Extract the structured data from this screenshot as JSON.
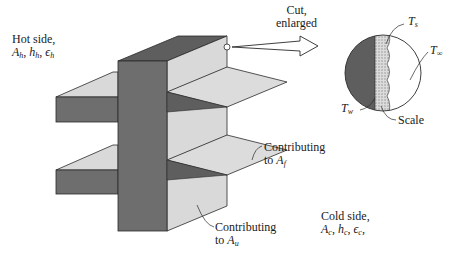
{
  "figure": {
    "hot_side": {
      "title": "Hot side,",
      "params": [
        {
          "sym": "A",
          "sub": "h"
        },
        {
          "sym": "h",
          "sub": "h"
        },
        {
          "sym": "ϵ",
          "sub": "h"
        }
      ]
    },
    "cold_side": {
      "title": "Cold side,",
      "params": [
        {
          "sym": "A",
          "sub": "c"
        },
        {
          "sym": "h",
          "sub": "c"
        },
        {
          "sym": "ϵ",
          "sub": "c"
        }
      ]
    },
    "cut_label": {
      "line1": "Cut,",
      "line2": "enlarged"
    },
    "contrib_fin": {
      "line1": "Contributing",
      "line2_prefix": "to ",
      "sym": "A",
      "sub": "f"
    },
    "contrib_unfinned": {
      "line1": "Contributing",
      "line2_prefix": "to ",
      "sym": "A",
      "sub": "u"
    },
    "inset": {
      "ts": {
        "sym": "T",
        "sub": "s"
      },
      "tinf": {
        "sym": "T",
        "sub": "∞"
      },
      "tw": {
        "sym": "T",
        "sub": "w"
      },
      "scale": "Scale"
    },
    "colors": {
      "wall_dark": "#6e6e6e",
      "fin_light": "#d9d9d9",
      "scale_band": "#c8c8c8",
      "outline": "#2a2a2a"
    }
  }
}
